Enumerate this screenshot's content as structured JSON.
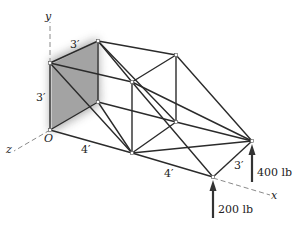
{
  "figure": {
    "axes": {
      "x": "x",
      "y": "y",
      "z": "z",
      "origin": "O"
    },
    "dimensions": {
      "top_left_depth": "3′",
      "left_height": "3′",
      "front_bottom_first": "4′",
      "front_bottom_second": "4′",
      "right_end_depth": "3′"
    },
    "loads": [
      {
        "label": "200 lb",
        "direction": "up"
      },
      {
        "label": "400 lb",
        "direction": "up"
      }
    ],
    "shaded_wall_color": "#a9a9a9",
    "member_color": "#2b2b2b",
    "caption": ""
  }
}
